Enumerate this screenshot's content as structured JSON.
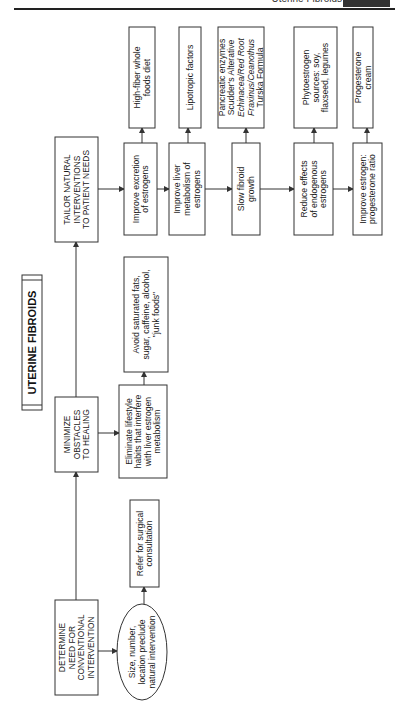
{
  "page_header": {
    "running_title": "Uterine Fibroids"
  },
  "diagram": {
    "title": "UTERINE FIBROIDS",
    "nodes": {
      "determine": [
        "DETERMINE",
        "NEED FOR",
        "CONVENTIONAL",
        "INTERVENTION"
      ],
      "size_number": [
        "Size, number,",
        "location preclude",
        "natural intervention"
      ],
      "refer": [
        "Refer for surgical",
        "consultation"
      ],
      "minimize": [
        "MINIMIZE",
        "OBSTACLES",
        "TO HEALING"
      ],
      "eliminate": [
        "Eliminate lifestyle",
        "habits that interfere",
        "with liver estrogen",
        "metabolism"
      ],
      "avoid": [
        "Avoid saturated fats,",
        "sugar, caffeine, alcohol,",
        "\"junk foods\""
      ],
      "tailor": [
        "TAILOR NATURAL",
        "INTERVENTIONS",
        "TO PATIENT NEEDS"
      ],
      "improve_excretion": [
        "Improve excretion",
        "of estrogens"
      ],
      "high_fiber": [
        "High-fiber whole",
        "foods diet"
      ],
      "improve_liver": [
        "Improve liver",
        "metabolism of",
        "estrogens"
      ],
      "lipotropic": [
        "Lipotropic factors"
      ],
      "slow_fibroid": [
        "Slow fibroid",
        "growth"
      ],
      "pancreatic": [
        "Pancreatic enzymes",
        "Scudder's Alterative",
        "Echinacea/Red Root",
        "Fraxinus/Ceanothus",
        "Turska Formula"
      ],
      "reduce_effects": [
        "Reduce effects",
        "of endogenous",
        "estrogens"
      ],
      "phytoestrogen": [
        "Phytoestrogen",
        "sources: soy,",
        "flaxseed, legumes"
      ],
      "improve_ratio": [
        "Improve estrogen:",
        "progesterone ratio"
      ],
      "progesterone": [
        "Progesterone",
        "cream"
      ]
    },
    "italic_lines": {
      "pancreatic": [
        2,
        3
      ]
    }
  }
}
